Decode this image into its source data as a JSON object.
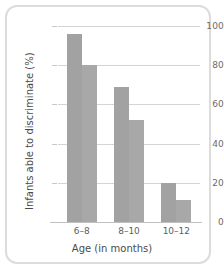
{
  "chart_data": {
    "type": "bar",
    "title": "",
    "subtitle": "",
    "xlabel": "Age (in months)",
    "ylabel": "Infants able to discriminate (%)",
    "categories": [
      "6–8",
      "8–10",
      "10–12"
    ],
    "series": [
      {
        "name": "series-1",
        "values": [
          96,
          69,
          20
        ],
        "color": "#a2a2a2"
      },
      {
        "name": "series-2",
        "values": [
          80,
          52,
          11
        ],
        "color": "#a8a8a8"
      }
    ],
    "ylim": [
      0,
      100
    ],
    "yticks": [
      0,
      20,
      40,
      60,
      80,
      100
    ],
    "ytick_labels": [
      "0",
      "20",
      "40",
      "60",
      "80",
      "100"
    ],
    "grid": "horizontal",
    "legend": "none",
    "annotations": []
  },
  "figure": {
    "background_color": "#ffffff",
    "border_color": "#dcdcdc",
    "gridline_color": "#d4d4d4",
    "axis_color": "#c0c0c0",
    "tick_label_color": "#6b6b6b",
    "axis_title_color": "#4a4a4a"
  }
}
